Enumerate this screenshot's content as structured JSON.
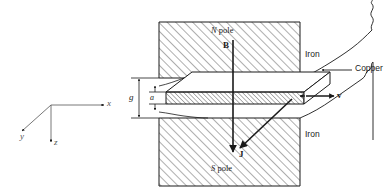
{
  "figure": {
    "background_color": "#ffffff",
    "line_color": "#1a1a1a"
  },
  "axes": {
    "name": "coordinate-axes",
    "origin_label": "",
    "x_label": "x",
    "y_label": "y",
    "z_label": "z"
  },
  "labels": {
    "north_pole": "N pole",
    "north_pole_prefix": "N",
    "north_pole_suffix": " pole",
    "south_pole": "S pole",
    "south_pole_prefix": "S",
    "south_pole_suffix": " pole",
    "iron_top": "Iron",
    "iron_bottom": "Iron",
    "copper": "Copper",
    "gap": "g",
    "thickness": "a"
  },
  "vectors": [
    {
      "name": "B",
      "label": "B",
      "description": "magnetic flux density, pointing down (+z)"
    },
    {
      "name": "J",
      "label": "J",
      "description": "current density, pointing down-left (+y)"
    },
    {
      "name": "v",
      "label": "v",
      "description": "bar velocity, pointing right (+x)"
    }
  ],
  "hatch": {
    "iron_pattern": "diagonal-45",
    "copper_pattern": "diagonal-45"
  }
}
